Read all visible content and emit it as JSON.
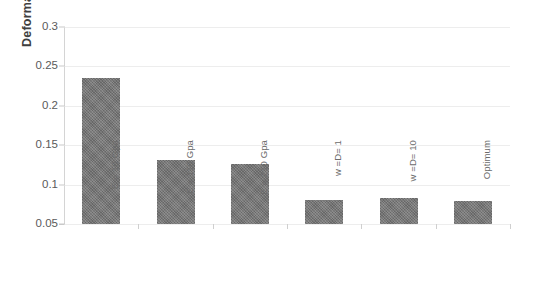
{
  "chart_data": {
    "type": "bar",
    "title": "",
    "xlabel": "",
    "ylabel": "Deformation",
    "categories": [
      "E = 10 Gpa",
      "E = 110 Gpa",
      "E = 210 Gpa",
      "w =D= 1",
      "w =D= 10",
      "Optimum"
    ],
    "values": [
      0.235,
      0.131,
      0.126,
      0.08,
      0.083,
      0.079
    ],
    "ylim": [
      0.05,
      0.3
    ],
    "ytick_labels": [
      "0.05",
      "0.1",
      "0.15",
      "0.2",
      "0.25",
      "0.3"
    ],
    "ytick_values": [
      0.05,
      0.1,
      0.15,
      0.2,
      0.25,
      0.3
    ],
    "grid": true,
    "legend": null,
    "legend_position": "none",
    "series": [
      {
        "name": "Deformation",
        "values": [
          0.235,
          0.131,
          0.126,
          0.08,
          0.083,
          0.079
        ]
      }
    ]
  },
  "style": {
    "bar_color": "#757575",
    "gridline_color": "#ededed",
    "axis_color": "#c9c9c9",
    "tick_label_color": "#5a5a5a",
    "axis_title_color": "#3f3f3f",
    "background": "#ffffff"
  }
}
